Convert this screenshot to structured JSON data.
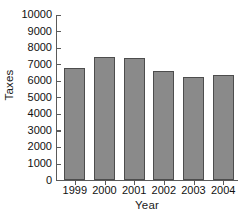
{
  "chart_data": {
    "type": "bar",
    "title": "",
    "xlabel": "Year",
    "ylabel": "Taxes",
    "categories": [
      "1999",
      "2000",
      "2001",
      "2002",
      "2003",
      "2004"
    ],
    "values": [
      6750,
      7400,
      7350,
      6550,
      6200,
      6300
    ],
    "ylim": [
      0,
      10000
    ],
    "ytick_step": 1000,
    "ytick_labels": [
      "10000",
      "9000",
      "8000",
      "7000",
      "6000",
      "5000",
      "4000",
      "3000",
      "2000",
      "1000",
      "0"
    ],
    "ytick_values": [
      10000,
      9000,
      8000,
      7000,
      6000,
      5000,
      4000,
      3000,
      2000,
      1000,
      0
    ],
    "grid": false,
    "legend": null,
    "bar_color": "#8a8a8a",
    "bar_edge_color": "#4d4d4d",
    "axis_color": "#5a5a5a",
    "background_color": "#ffffff"
  }
}
